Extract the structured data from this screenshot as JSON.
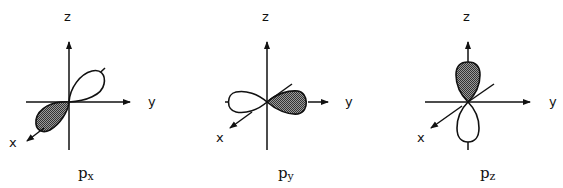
{
  "colors": {
    "stroke": "#111111",
    "shaded": "#6a6a6a",
    "background": "#ffffff"
  },
  "panels": [
    {
      "name": "px",
      "orbital_main": "p",
      "orbital_sub": "x",
      "axes": {
        "z": "z",
        "y": "y",
        "x": "x"
      },
      "shaded_lobe": "toward -x (front-lower-left)",
      "unshaded_lobe": "toward +x back (upper-right)"
    },
    {
      "name": "py",
      "orbital_main": "p",
      "orbital_sub": "y",
      "axes": {
        "z": "z",
        "y": "y",
        "x": "x"
      },
      "shaded_lobe": "toward +y (right)",
      "unshaded_lobe": "toward -y (left)"
    },
    {
      "name": "pz",
      "orbital_main": "p",
      "orbital_sub": "z",
      "axes": {
        "z": "z",
        "y": "y",
        "x": "x"
      },
      "shaded_lobe": "toward +z (up)",
      "unshaded_lobe": "toward -z (down)"
    }
  ]
}
